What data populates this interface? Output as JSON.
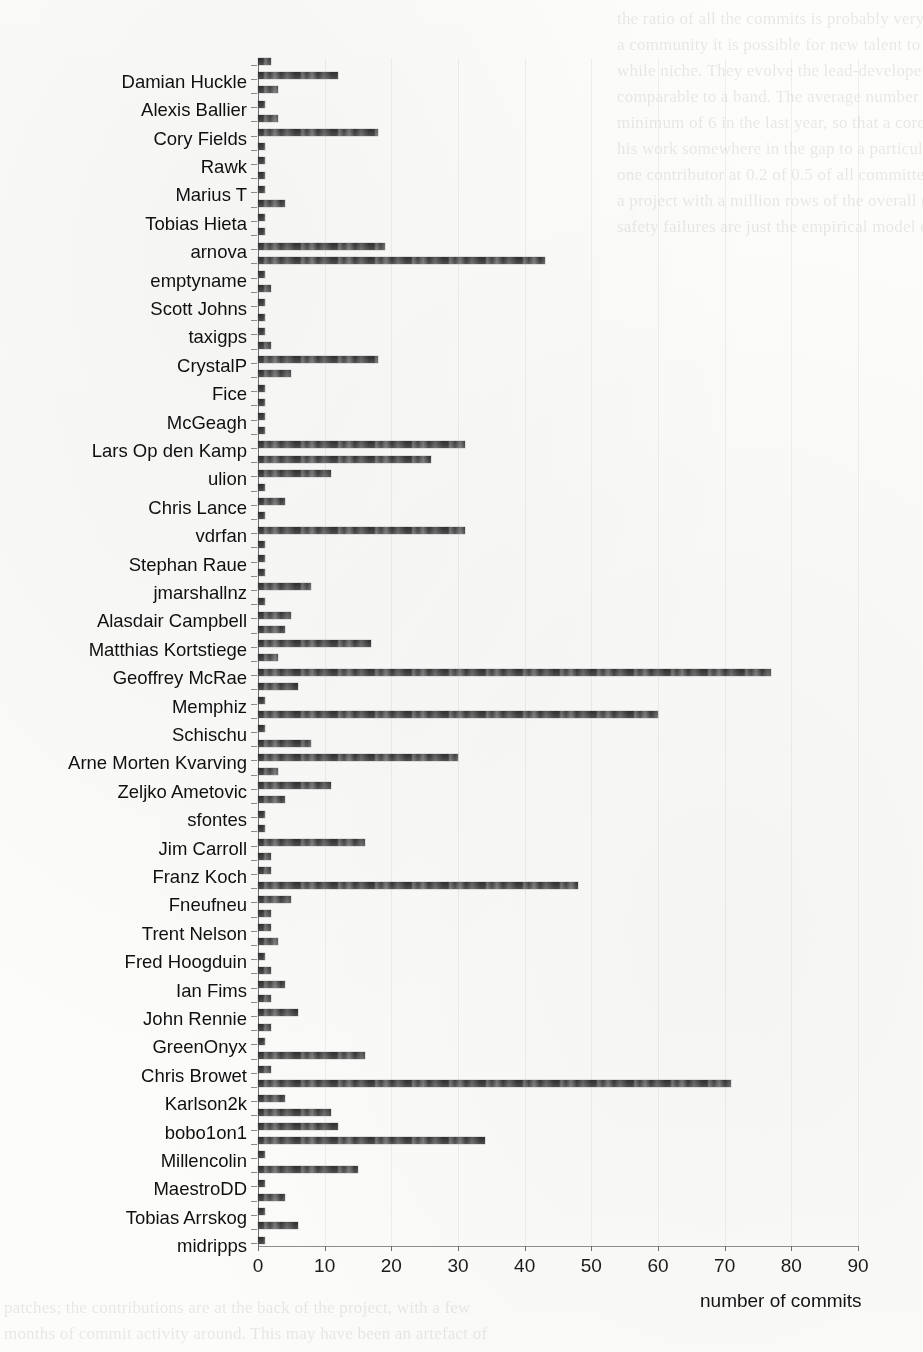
{
  "chart_data": {
    "type": "bar",
    "orientation": "horizontal",
    "title": "",
    "xlabel": "number of commits",
    "ylabel": "",
    "xlim": [
      0,
      90
    ],
    "xticks": [
      0,
      10,
      20,
      30,
      40,
      50,
      60,
      70,
      80,
      90
    ],
    "grid": true,
    "legend": "none",
    "bar_color": "#3a3a3a",
    "note": "Horizontal bar chart. One bar per contributor; y tick labels are printed for alternating rows only.",
    "categories": [
      "Damian Huckle",
      "Alexis Ballier",
      "Cory Fields",
      "Rawk",
      "Marius T",
      "Tobias Hieta",
      "arnova",
      "emptyname",
      "Scott Johns",
      "taxigps",
      "CrystalP",
      "Fice",
      "McGeagh",
      "Lars Op den Kamp",
      "ulion",
      "Chris Lance",
      "vdrfan",
      "Stephan Raue",
      "jmarshallnz",
      "Alasdair Campbell",
      "Matthias Kortstiege",
      "Geoffrey McRae",
      "Memphiz",
      "Schischu",
      "Arne Morten Kvarving",
      "Zeljko Ametovic",
      "sfontes",
      "Jim Carroll",
      "Franz Koch",
      "Fneufneu",
      "Trent Nelson",
      "Fred Hoogduin",
      "Ian Fims",
      "John Rennie",
      "GreenOnyx",
      "Chris Browet",
      "Karlson2k",
      "bobo1on1",
      "Millencolin",
      "MaestroDD",
      "Tobias Arrskog",
      "midripps"
    ],
    "values": [
      12,
      2,
      18,
      2,
      2,
      4,
      19,
      43,
      2,
      2,
      18,
      2,
      2,
      31,
      11,
      4,
      31,
      2,
      8,
      5,
      17,
      77,
      60,
      2,
      30,
      11,
      4,
      16,
      2,
      48,
      2,
      2,
      4,
      6,
      2,
      71,
      4,
      12,
      34,
      15,
      4,
      6
    ],
    "rows": [
      {
        "label": "",
        "value": 2
      },
      {
        "label": "Damian Huckle",
        "value": 12
      },
      {
        "label": "",
        "value": 3
      },
      {
        "label": "Alexis Ballier",
        "value": 1
      },
      {
        "label": "",
        "value": 3
      },
      {
        "label": "Cory Fields",
        "value": 18
      },
      {
        "label": "",
        "value": 1
      },
      {
        "label": "Rawk",
        "value": 1
      },
      {
        "label": "",
        "value": 1
      },
      {
        "label": "Marius T",
        "value": 1
      },
      {
        "label": "",
        "value": 4
      },
      {
        "label": "Tobias Hieta",
        "value": 1
      },
      {
        "label": "",
        "value": 1
      },
      {
        "label": "arnova",
        "value": 19
      },
      {
        "label": "",
        "value": 43
      },
      {
        "label": "emptyname",
        "value": 1
      },
      {
        "label": "",
        "value": 2
      },
      {
        "label": "Scott Johns",
        "value": 1
      },
      {
        "label": "",
        "value": 1
      },
      {
        "label": "taxigps",
        "value": 1
      },
      {
        "label": "",
        "value": 2
      },
      {
        "label": "CrystalP",
        "value": 18
      },
      {
        "label": "",
        "value": 5
      },
      {
        "label": "Fice",
        "value": 1
      },
      {
        "label": "",
        "value": 1
      },
      {
        "label": "McGeagh",
        "value": 1
      },
      {
        "label": "",
        "value": 1
      },
      {
        "label": "Lars Op den Kamp",
        "value": 31
      },
      {
        "label": "",
        "value": 26
      },
      {
        "label": "ulion",
        "value": 11
      },
      {
        "label": "",
        "value": 1
      },
      {
        "label": "Chris Lance",
        "value": 4
      },
      {
        "label": "",
        "value": 1
      },
      {
        "label": "vdrfan",
        "value": 31
      },
      {
        "label": "",
        "value": 1
      },
      {
        "label": "Stephan Raue",
        "value": 1
      },
      {
        "label": "",
        "value": 1
      },
      {
        "label": "jmarshallnz",
        "value": 8
      },
      {
        "label": "",
        "value": 1
      },
      {
        "label": "Alasdair Campbell",
        "value": 5
      },
      {
        "label": "",
        "value": 4
      },
      {
        "label": "Matthias Kortstiege",
        "value": 17
      },
      {
        "label": "",
        "value": 3
      },
      {
        "label": "Geoffrey McRae",
        "value": 77
      },
      {
        "label": "",
        "value": 6
      },
      {
        "label": "Memphiz",
        "value": 1
      },
      {
        "label": "",
        "value": 60
      },
      {
        "label": "Schischu",
        "value": 1
      },
      {
        "label": "",
        "value": 8
      },
      {
        "label": "Arne Morten Kvarving",
        "value": 30
      },
      {
        "label": "",
        "value": 3
      },
      {
        "label": "Zeljko Ametovic",
        "value": 11
      },
      {
        "label": "",
        "value": 4
      },
      {
        "label": "sfontes",
        "value": 1
      },
      {
        "label": "",
        "value": 1
      },
      {
        "label": "Jim Carroll",
        "value": 16
      },
      {
        "label": "",
        "value": 2
      },
      {
        "label": "Franz Koch",
        "value": 2
      },
      {
        "label": "",
        "value": 48
      },
      {
        "label": "Fneufneu",
        "value": 5
      },
      {
        "label": "",
        "value": 2
      },
      {
        "label": "Trent Nelson",
        "value": 2
      },
      {
        "label": "",
        "value": 3
      },
      {
        "label": "Fred Hoogduin",
        "value": 1
      },
      {
        "label": "",
        "value": 2
      },
      {
        "label": "Ian Fims",
        "value": 4
      },
      {
        "label": "",
        "value": 2
      },
      {
        "label": "John Rennie",
        "value": 6
      },
      {
        "label": "",
        "value": 2
      },
      {
        "label": "GreenOnyx",
        "value": 1
      },
      {
        "label": "",
        "value": 16
      },
      {
        "label": "Chris Browet",
        "value": 2
      },
      {
        "label": "",
        "value": 71
      },
      {
        "label": "Karlson2k",
        "value": 4
      },
      {
        "label": "",
        "value": 11
      },
      {
        "label": "bobo1on1",
        "value": 12
      },
      {
        "label": "",
        "value": 34
      },
      {
        "label": "Millencolin",
        "value": 1
      },
      {
        "label": "",
        "value": 15
      },
      {
        "label": "MaestroDD",
        "value": 1
      },
      {
        "label": "",
        "value": 4
      },
      {
        "label": "Tobias Arrskog",
        "value": 1
      },
      {
        "label": "",
        "value": 6
      },
      {
        "label": "midripps",
        "value": 1
      }
    ]
  },
  "axis": {
    "x_title": "number of commits",
    "x_tick_labels": [
      "0",
      "10",
      "20",
      "30",
      "40",
      "50",
      "60",
      "70",
      "80",
      "90"
    ]
  },
  "page": {
    "background_text_right": "the ratio of all the commits is probably very high, and that in such\na community it is possible for new talent to rise and claim a worth-\nwhile niche. They evolve the lead-developer profile into something\ncomparable to a band. The average number of developers is 32.33\nminimum of 6 in the last year, so that a core worker is able to make\nhis work somewhere in the gap to a particular one. Figure 2 shows that\none contributor at 0.2 of 0.5 of all committers is the average level of\na project with a million rows of the overall median. Another set of\nsafety failures are just the empirical model evaluation.",
    "background_text_left": "patches; the contributions are at the back of the project, with a few\nmonths of commit activity around. This may have been an artefact of\nthe sample or the way we collected the data; at most of the public"
  }
}
